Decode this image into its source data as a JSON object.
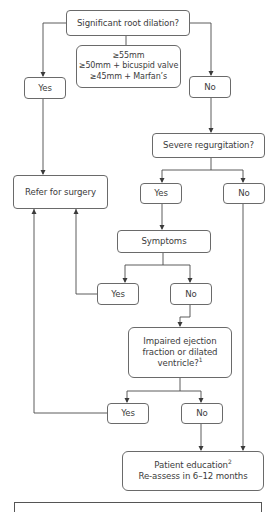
{
  "diagram": {
    "type": "flowchart",
    "nodes": {
      "root_question": "Significant root dilation?",
      "criteria": {
        "line1": "≥55mm",
        "line2": "≥50mm + bicuspid valve",
        "line3": "≥45mm + Marfan’s"
      },
      "root_yes": "Yes",
      "root_no": "No",
      "refer_surgery": "Refer for surgery",
      "regurg_question": "Severe regurgitation?",
      "regurg_yes": "Yes",
      "regurg_no": "No",
      "symptoms": "Symptoms",
      "symptoms_yes": "Yes",
      "symptoms_no": "No",
      "ef_question": {
        "line1": "Impaired ejection",
        "line2": "fraction or dilated",
        "line3": "ventricle?",
        "sup": "1"
      },
      "ef_yes": "Yes",
      "ef_no": "No",
      "patient_education": {
        "line1": "Patient education",
        "sup": "2",
        "line2": "Re-assess in 6–12 months"
      }
    },
    "colors": {
      "line": "#4a4a4a",
      "border": "#6a6a6a",
      "text": "#3c3c3c",
      "background": "#ffffff"
    }
  }
}
